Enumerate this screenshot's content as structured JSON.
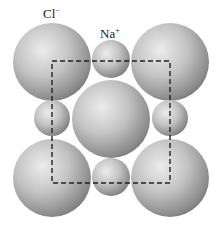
{
  "labels": {
    "anion": "Cl",
    "anion_charge": "−",
    "cation": "Na",
    "cation_charge": "+"
  },
  "colors": {
    "background": "#ffffff",
    "sphere_light": "#e6e6e6",
    "sphere_mid": "#b5b5b5",
    "sphere_dark": "#6e6e6e",
    "dashed_line": "#222222"
  },
  "spheres": [
    {
      "ion": "Cl-",
      "cx": 52,
      "cy": 62,
      "r": 39
    },
    {
      "ion": "Cl-",
      "cx": 170,
      "cy": 62,
      "r": 39
    },
    {
      "ion": "Cl-",
      "cx": 111,
      "cy": 119,
      "r": 39
    },
    {
      "ion": "Cl-",
      "cx": 52,
      "cy": 178,
      "r": 39
    },
    {
      "ion": "Cl-",
      "cx": 170,
      "cy": 178,
      "r": 39
    },
    {
      "ion": "Na+",
      "cx": 111,
      "cy": 59,
      "r": 19
    },
    {
      "ion": "Na+",
      "cx": 52,
      "cy": 118,
      "r": 18
    },
    {
      "ion": "Na+",
      "cx": 170,
      "cy": 118,
      "r": 18
    },
    {
      "ion": "Na+",
      "cx": 111,
      "cy": 177,
      "r": 19
    }
  ],
  "unit_cell_box": {
    "x": 52,
    "y": 61,
    "width": 118,
    "height": 122
  }
}
